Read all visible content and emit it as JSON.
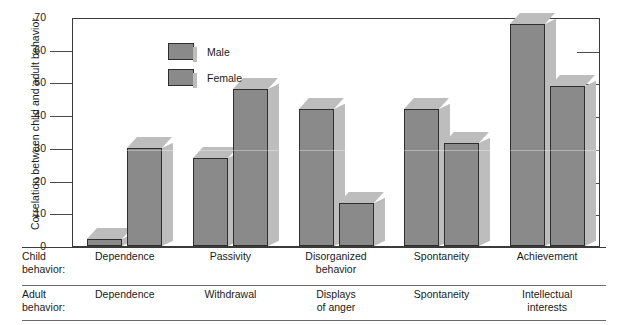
{
  "chart_data": {
    "type": "bar",
    "title": "",
    "xlabel": "",
    "ylabel": "Correlation between child and adult behavior",
    "ylim": [
      0,
      0.7
    ],
    "ytick_labels": [
      "0",
      ".10",
      ".20",
      ".30",
      ".40",
      ".50",
      ".60",
      ".70"
    ],
    "ytick_values": [
      0,
      0.1,
      0.2,
      0.3,
      0.4,
      0.5,
      0.6,
      0.7
    ],
    "grid": false,
    "legend_position": "top-left",
    "categories": [
      "Dependence",
      "Passivity",
      "Disorganized behavior",
      "Spontaneity",
      "Achievement"
    ],
    "series": [
      {
        "name": "Male",
        "values": [
          0.02,
          0.27,
          0.42,
          0.42,
          0.68
        ]
      },
      {
        "name": "Female",
        "values": [
          0.3,
          0.48,
          0.13,
          0.315,
          0.49
        ]
      }
    ],
    "child_behavior_labels": [
      "Dependence",
      "Passivity",
      "Disorganized behavior",
      "Spontaneity",
      "Achievement"
    ],
    "adult_behavior_labels": [
      "Dependence",
      "Withdrawal",
      "Displays of anger",
      "Spontaneity",
      "Intellectual interests"
    ],
    "colors": {
      "bar_face": "#8a8a8a",
      "bar_shadow": "#bdbdbd",
      "bar_outline": "#2e2e2e",
      "axis": "#3a3a3a",
      "text": "#1a1a1a"
    }
  },
  "legend": {
    "items": [
      {
        "label": "Male"
      },
      {
        "label": "Female"
      }
    ]
  },
  "axis": {
    "y_title": "Correlation between child and adult behavior",
    "ticks": [
      {
        "label": ".70"
      },
      {
        "label": ".60"
      },
      {
        "label": ".50"
      },
      {
        "label": ".40"
      },
      {
        "label": ".30"
      },
      {
        "label": ".20"
      },
      {
        "label": ".10"
      },
      {
        "label": "0"
      }
    ]
  },
  "label_table": {
    "child_row_title_line1": "Child",
    "child_row_title_line2": "behavior:",
    "adult_row_title_line1": "Adult",
    "adult_row_title_line2": "behavior:",
    "child_cells": [
      {
        "line1": "Dependence",
        "line2": ""
      },
      {
        "line1": "Passivity",
        "line2": ""
      },
      {
        "line1": "Disorganized",
        "line2": "behavior"
      },
      {
        "line1": "Spontaneity",
        "line2": ""
      },
      {
        "line1": "Achievement",
        "line2": ""
      }
    ],
    "adult_cells": [
      {
        "line1": "Dependence",
        "line2": ""
      },
      {
        "line1": "Withdrawal",
        "line2": ""
      },
      {
        "line1": "Displays",
        "line2": "of anger"
      },
      {
        "line1": "Spontaneity",
        "line2": ""
      },
      {
        "line1": "Intellectual",
        "line2": "interests"
      }
    ]
  }
}
